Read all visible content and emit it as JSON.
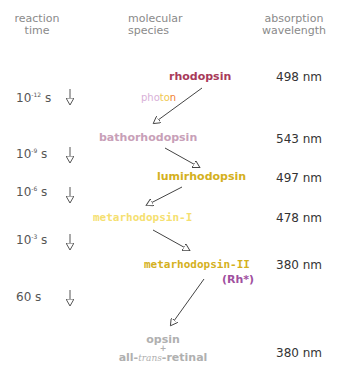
{
  "headers": {
    "time": [
      "reaction",
      "time"
    ],
    "species": [
      "molecular",
      "species"
    ],
    "wavelength": [
      "absorption",
      "wavelength"
    ]
  },
  "stimulus": {
    "label_parts": [
      "pho",
      "to",
      "n"
    ],
    "colors": [
      "#d8b0d8",
      "#f0c850",
      "#f08030"
    ]
  },
  "species": [
    {
      "name": "rhodopsin",
      "color": "#a83a5a",
      "wavelength": "498 nm"
    },
    {
      "name": "bathorhodopsin",
      "color": "#c8a0b8",
      "wavelength": "543 nm"
    },
    {
      "name": "lumirhodopsin",
      "color": "#d4b020",
      "wavelength": "497 nm"
    },
    {
      "name": "metarhodopsin-I",
      "color": "#f5e070",
      "wavelength": "478 nm"
    },
    {
      "name": "metarhodopsin-II",
      "color": "#d4b020",
      "wavelength": "380 nm",
      "note": "(Rh*)",
      "note_color": "#a050a0"
    },
    {
      "name_parts": [
        "opsin",
        "+",
        "all-",
        "trans",
        "-retinal"
      ],
      "color": "#b0b0b0",
      "wavelength": "380 nm"
    }
  ],
  "times": [
    {
      "base": "10",
      "exp": "-12",
      "unit": "s"
    },
    {
      "base": "10",
      "exp": "-9",
      "unit": "s"
    },
    {
      "base": "10",
      "exp": "-6",
      "unit": "s"
    },
    {
      "base": "10",
      "exp": "-3",
      "unit": "s"
    },
    {
      "base": "60",
      "exp": "",
      "unit": "s"
    }
  ]
}
